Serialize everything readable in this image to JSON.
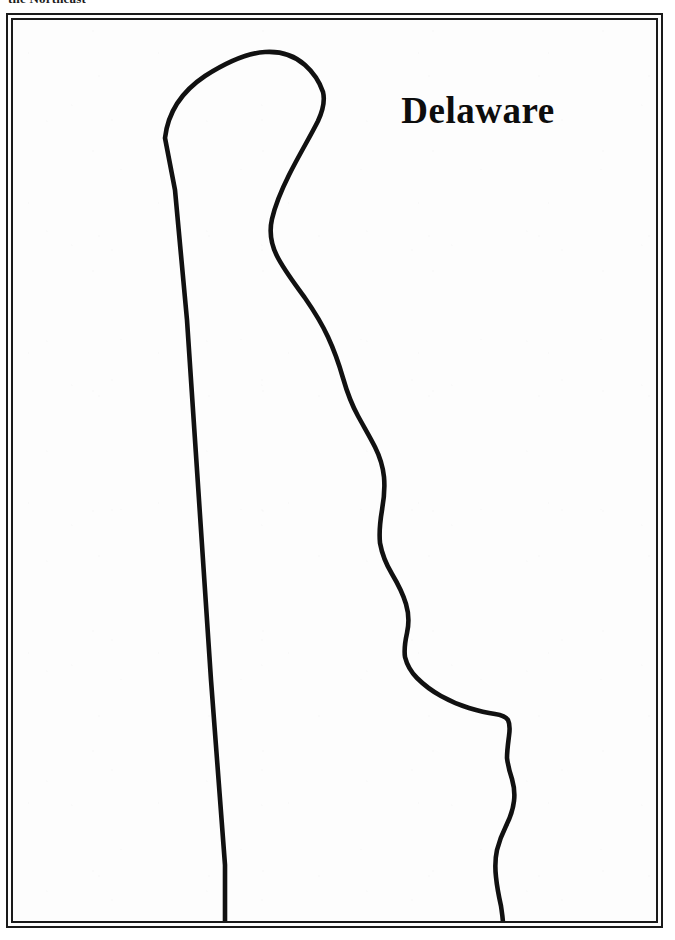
{
  "page": {
    "running_head": "the Northeast",
    "background_color": "#ffffff"
  },
  "plate": {
    "name": "framed-map-plate",
    "border_color": "#1a1a1a",
    "fill_color": "#fdfdfd",
    "style": "double-rule"
  },
  "map": {
    "title": "Delaware",
    "title_color": "#0d0d0d",
    "outline_color": "#111111",
    "outline_fill": "none",
    "type": "state-outline-map",
    "subject": "Delaware",
    "region": "the Northeast",
    "features": [
      "twelve-mile-arc-northern-boundary",
      "western-straight-boundary",
      "delaware-river-and-bay-eastern-shore",
      "cape-henlopen",
      "atlantic-ocean-coast",
      "transpeninsular-southern-boundary"
    ]
  },
  "chart_data": {
    "type": "map-outline",
    "title": "Delaware",
    "labels": [
      "Delaware"
    ],
    "annotations": [
      "the Northeast"
    ],
    "viewbox": [
      0,
      0,
      649,
      907
    ],
    "outline_path": "M 152 118 C 155 92 168 72 192 56 C 214 42 236 33 252 32 C 268 31 282 36 292 45 C 301 53 307 63 310 72 C 312 80 310 90 305 101 C 297 117 286 135 276 155 C 268 171 262 186 259 199 C 256 212 258 224 264 236 C 271 250 282 264 292 278 C 301 291 309 304 315 317 C 321 330 326 344 330 358 C 334 372 339 385 345 396 C 351 407 357 417 362 427 C 367 437 370 447 371 457 C 372 468 371 479 369 490 C 367 502 366 513 367 523 C 369 534 373 544 379 554 C 385 564 390 574 393 584 C 396 594 396 604 394 613 C 392 622 391 630 392 637 C 394 645 398 652 404 658 C 411 665 419 671 428 676 C 437 681 446 685 456 688 C 466 691 475 693 482 694 C 489 695 493 697 495 700 C 497 704 497 709 496 716 C 495 724 494 731 494 738 C 495 746 497 753 499 759 C 501 766 502 773 501 781 C 500 790 497 798 493 806 C 489 814 486 822 484 830 C 482 839 482 848 483 857 C 484 867 486 877 488 886 C 489 893 490 899 490 904 L 212 904 L 212 845 L 198 660 L 186 480 L 174 300 L 162 170 Z"
  }
}
